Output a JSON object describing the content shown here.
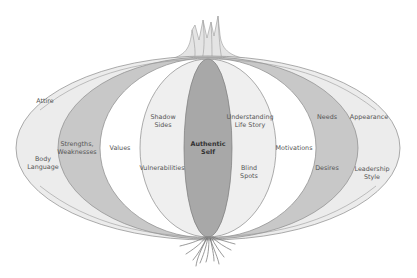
{
  "diagram": {
    "type": "onion-layers",
    "colors": {
      "outer_layer": "#ececec",
      "second_layer": "#c8c8c8",
      "third_layer": "#ffffff",
      "fourth_layer": "#efefef",
      "core": "#a8a8a8",
      "stroke": "#8a8a8a",
      "sprout": "#bdbdbd",
      "roots": "#7a7a7a"
    },
    "center": {
      "label_line1": "Authentic",
      "label_line2": "Self"
    },
    "left": {
      "outer": [
        {
          "line1": "Attire",
          "line2": ""
        },
        {
          "line1": "Body",
          "line2": "Language"
        }
      ],
      "second": [
        {
          "line1": "Strengths,",
          "line2": "Weaknesses"
        }
      ],
      "third": [
        {
          "line1": "Values",
          "line2": ""
        }
      ],
      "fourth": [
        {
          "line1": "Shadow",
          "line2": "Sides"
        },
        {
          "line1": "Vulnerabilities",
          "line2": ""
        }
      ]
    },
    "right": {
      "fourth": [
        {
          "line1": "Understanding",
          "line2": "Life Story"
        },
        {
          "line1": "Blind",
          "line2": "Spots"
        }
      ],
      "third": [
        {
          "line1": "Motivations",
          "line2": ""
        }
      ],
      "second": [
        {
          "line1": "Needs",
          "line2": ""
        },
        {
          "line1": "Desires",
          "line2": ""
        }
      ],
      "outer": [
        {
          "line1": "Appearance",
          "line2": ""
        },
        {
          "line1": "Leadership",
          "line2": "Style"
        }
      ]
    }
  }
}
